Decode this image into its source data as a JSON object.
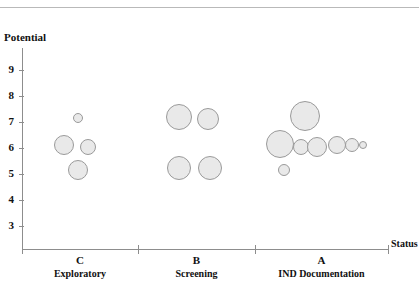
{
  "chart_data": {
    "type": "scatter",
    "title": "",
    "xlabel": "Status",
    "ylabel": "Potential",
    "grid": false,
    "legend": "none",
    "ylim": [
      3,
      9.6
    ],
    "y_ticks": [
      9,
      8,
      7,
      6,
      5,
      4,
      3
    ],
    "y_tick_labels": [
      "9",
      "8",
      "7",
      "6",
      "5",
      "4",
      "3"
    ],
    "x_categories": [
      {
        "code": "C",
        "name": "Exploratory"
      },
      {
        "code": "B",
        "name": "Screening"
      },
      {
        "code": "A",
        "name": "IND Documentation"
      }
    ],
    "x_tick_count": 4,
    "bubble_fill": "#e9e9e9",
    "bubble_stroke": "#9a9a9a",
    "series": [
      {
        "name": "Exploratory",
        "category": "C",
        "points": [
          {
            "y": 7.15,
            "size": 10
          },
          {
            "y": 6.1,
            "size": 20
          },
          {
            "y": 6.05,
            "size": 16
          },
          {
            "y": 5.15,
            "size": 20
          }
        ]
      },
      {
        "name": "Screening",
        "category": "B",
        "points": [
          {
            "y": 7.2,
            "size": 26
          },
          {
            "y": 7.1,
            "size": 22
          },
          {
            "y": 5.25,
            "size": 24
          },
          {
            "y": 5.25,
            "size": 24
          }
        ]
      },
      {
        "name": "IND Documentation",
        "category": "A",
        "points": [
          {
            "y": 7.25,
            "size": 30
          },
          {
            "y": 6.15,
            "size": 28
          },
          {
            "y": 6.05,
            "size": 16
          },
          {
            "y": 6.05,
            "size": 20
          },
          {
            "y": 6.1,
            "size": 18
          },
          {
            "y": 6.1,
            "size": 14
          },
          {
            "y": 6.1,
            "size": 8
          },
          {
            "y": 5.15,
            "size": 12
          }
        ]
      }
    ]
  },
  "axes": {
    "y_title": "Potential",
    "x_title": "Status"
  }
}
